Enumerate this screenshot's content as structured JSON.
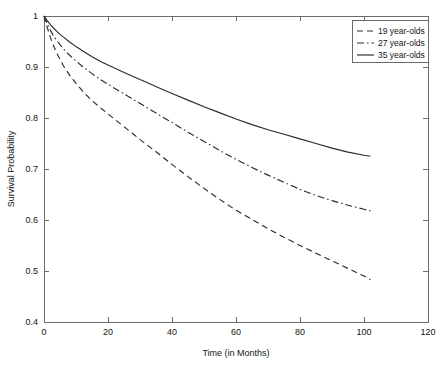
{
  "chart_data": {
    "type": "line",
    "title": "",
    "xlabel": "Time (in Months)",
    "ylabel": "Survival Probability",
    "xlim": [
      0,
      120
    ],
    "ylim": [
      0.4,
      1.0
    ],
    "xticks": [
      0,
      20,
      40,
      60,
      80,
      100,
      120
    ],
    "xticklabels": [
      "0",
      "20",
      "40",
      "60",
      "80",
      "100",
      "120"
    ],
    "yticks": [
      0.4,
      0.5,
      0.6,
      0.7,
      0.8,
      0.9,
      1.0
    ],
    "yticklabels": [
      "0.4",
      "0.5",
      "0.6",
      "0.7",
      "0.8",
      "0.9",
      "1"
    ],
    "grid": false,
    "legend_position": "upper right",
    "series": [
      {
        "name": "19 year-olds",
        "style": "dashed",
        "color": "#2b2b2b",
        "x": [
          0,
          1,
          2,
          3,
          4,
          5,
          6,
          8,
          10,
          12,
          15,
          18,
          20,
          24,
          28,
          32,
          36,
          40,
          45,
          50,
          55,
          60,
          65,
          70,
          75,
          80,
          85,
          90,
          95,
          100,
          102
        ],
        "y": [
          1.0,
          0.978,
          0.958,
          0.941,
          0.927,
          0.915,
          0.903,
          0.884,
          0.868,
          0.853,
          0.834,
          0.818,
          0.808,
          0.788,
          0.768,
          0.748,
          0.729,
          0.709,
          0.685,
          0.662,
          0.64,
          0.619,
          0.601,
          0.583,
          0.566,
          0.55,
          0.535,
          0.52,
          0.505,
          0.49,
          0.483
        ]
      },
      {
        "name": "27 year-olds",
        "style": "dashdot",
        "color": "#2b2b2b",
        "x": [
          0,
          1,
          2,
          3,
          4,
          5,
          6,
          8,
          10,
          12,
          15,
          18,
          20,
          24,
          28,
          32,
          36,
          40,
          45,
          50,
          55,
          60,
          65,
          70,
          75,
          80,
          85,
          90,
          95,
          100,
          102
        ],
        "y": [
          1.0,
          0.985,
          0.972,
          0.961,
          0.952,
          0.944,
          0.936,
          0.923,
          0.912,
          0.901,
          0.887,
          0.874,
          0.866,
          0.851,
          0.836,
          0.821,
          0.806,
          0.791,
          0.772,
          0.754,
          0.736,
          0.719,
          0.703,
          0.688,
          0.674,
          0.66,
          0.648,
          0.638,
          0.629,
          0.621,
          0.618
        ]
      },
      {
        "name": "35 year-olds",
        "style": "solid",
        "color": "#2b2b2b",
        "x": [
          0,
          1,
          2,
          3,
          4,
          5,
          6,
          8,
          10,
          12,
          15,
          18,
          20,
          24,
          28,
          32,
          36,
          40,
          45,
          50,
          55,
          60,
          65,
          70,
          75,
          80,
          85,
          90,
          95,
          100,
          102
        ],
        "y": [
          1.0,
          0.991,
          0.983,
          0.976,
          0.97,
          0.964,
          0.959,
          0.949,
          0.94,
          0.932,
          0.92,
          0.91,
          0.904,
          0.892,
          0.881,
          0.87,
          0.859,
          0.848,
          0.835,
          0.822,
          0.81,
          0.798,
          0.787,
          0.777,
          0.768,
          0.759,
          0.75,
          0.741,
          0.733,
          0.727,
          0.725
        ]
      }
    ]
  }
}
